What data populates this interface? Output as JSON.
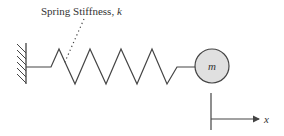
{
  "diagram": {
    "spring_label": "Spring Stiffness, ",
    "spring_symbol": "k",
    "mass_label": "m",
    "axis_label": "x",
    "colors": {
      "line": "#444444",
      "mass_fill": "#e0e0e0",
      "text": "#333333"
    }
  }
}
